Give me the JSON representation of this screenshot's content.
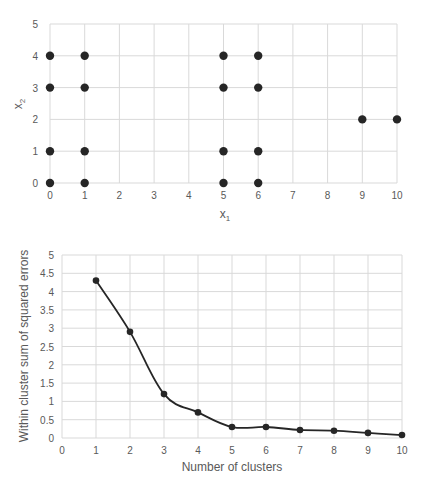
{
  "colors": {
    "grid": "#d9d9d9",
    "tick_text": "#595959",
    "marker": "#262626",
    "line": "#262626",
    "background": "#ffffff"
  },
  "chart_data": [
    {
      "type": "scatter",
      "title": "",
      "xlabel": "x1",
      "xlabel_main": "x",
      "xlabel_sub": "1",
      "ylabel": "x2",
      "ylabel_main": "x",
      "ylabel_sub": "2",
      "xlim": [
        0,
        10
      ],
      "ylim": [
        0,
        5
      ],
      "xticks": [
        "0",
        "1",
        "2",
        "3",
        "4",
        "5",
        "6",
        "7",
        "8",
        "9",
        "10"
      ],
      "yticks": [
        "0",
        "1",
        "2",
        "3",
        "4",
        "5"
      ],
      "grid": true,
      "legend": null,
      "points": [
        {
          "x": 0,
          "y": 0
        },
        {
          "x": 0,
          "y": 1
        },
        {
          "x": 0,
          "y": 3
        },
        {
          "x": 0,
          "y": 4
        },
        {
          "x": 1,
          "y": 0
        },
        {
          "x": 1,
          "y": 1
        },
        {
          "x": 1,
          "y": 3
        },
        {
          "x": 1,
          "y": 4
        },
        {
          "x": 5,
          "y": 0
        },
        {
          "x": 5,
          "y": 1
        },
        {
          "x": 5,
          "y": 3
        },
        {
          "x": 5,
          "y": 4
        },
        {
          "x": 6,
          "y": 0
        },
        {
          "x": 6,
          "y": 1
        },
        {
          "x": 6,
          "y": 3
        },
        {
          "x": 6,
          "y": 4
        },
        {
          "x": 9,
          "y": 2
        },
        {
          "x": 10,
          "y": 2
        }
      ]
    },
    {
      "type": "line",
      "title": "",
      "xlabel": "Number of clusters",
      "ylabel": "Within cluster sum of squared errors",
      "xlim": [
        0,
        10
      ],
      "ylim": [
        0,
        5
      ],
      "xticks": [
        "0",
        "1",
        "2",
        "3",
        "4",
        "5",
        "6",
        "7",
        "8",
        "9",
        "10"
      ],
      "yticks": [
        "0",
        "0.5",
        "1",
        "1.5",
        "2",
        "2.5",
        "3",
        "3.5",
        "4",
        "4.5",
        "5"
      ],
      "grid": true,
      "legend": null,
      "smooth": true,
      "x": [
        1,
        2,
        3,
        4,
        5,
        6,
        7,
        8,
        9,
        10
      ],
      "series": [
        {
          "name": "SSE",
          "values": [
            4.3,
            2.9,
            1.2,
            0.7,
            0.3,
            0.3,
            0.22,
            0.2,
            0.14,
            0.08
          ]
        }
      ]
    }
  ]
}
